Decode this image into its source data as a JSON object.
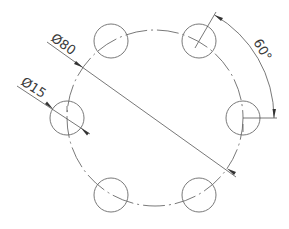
{
  "drawing": {
    "background": "#ffffff",
    "line_color": "#6a6a6a",
    "text_color": "#3a3a3a",
    "bolt_circle": {
      "cx": 155,
      "cy": 118,
      "r": 88,
      "style": "center-line (dash-dot)"
    },
    "holes": [
      {
        "id": "top-left",
        "cx": 111,
        "cy": 41,
        "r": 17
      },
      {
        "id": "top-right",
        "cx": 199,
        "cy": 41,
        "r": 17
      },
      {
        "id": "right",
        "cx": 243,
        "cy": 118,
        "r": 17
      },
      {
        "id": "bottom-right",
        "cx": 199,
        "cy": 195,
        "r": 17
      },
      {
        "id": "bottom-left",
        "cx": 111,
        "cy": 195,
        "r": 17
      },
      {
        "id": "left",
        "cx": 67,
        "cy": 118,
        "r": 17
      }
    ],
    "dimensions": {
      "bolt_circle_diameter": {
        "label": "Ø80"
      },
      "hole_diameter": {
        "label": "Ø15"
      },
      "angular_spacing": {
        "label": "60°"
      }
    }
  }
}
